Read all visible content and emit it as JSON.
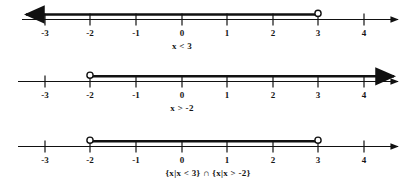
{
  "figure": {
    "title": "",
    "type": "number-line-inequality-diagram",
    "axis": {
      "tick_values": [
        -3,
        -2,
        -1,
        0,
        1,
        2,
        3,
        4
      ],
      "tick_labels": [
        "-3",
        "-2",
        "-1",
        "0",
        "1",
        "2",
        "3",
        "4"
      ],
      "x_min_visible": -3.6,
      "x_max_visible": 4.8
    },
    "lines": [
      {
        "id": "line-1",
        "caption": "x < 3",
        "caption_parts": {
          "variable": "x",
          "relation": "<",
          "value": "3"
        },
        "solution": {
          "kind": "ray-left",
          "endpoint": -3,
          "open_points": [
            3
          ],
          "arrow_left": true,
          "arrow_right": false
        },
        "baseline_arrow_left": true,
        "baseline_arrow_right": true
      },
      {
        "id": "line-2",
        "caption": "x > -2",
        "caption_parts": {
          "variable": "x",
          "relation": ">",
          "value": "-2"
        },
        "solution": {
          "kind": "ray-right",
          "endpoint": -2,
          "open_points": [
            -2
          ],
          "arrow_left": false,
          "arrow_right": true
        },
        "baseline_arrow_left": false,
        "baseline_arrow_right": true
      },
      {
        "id": "line-3",
        "caption": "{x|x < 3} ∩ {x|x > -2}",
        "caption_parts": {
          "set_a": "{x|x < 3}",
          "operator": "∩",
          "set_b": "{x|x > -2}"
        },
        "solution": {
          "kind": "segment",
          "open_points": [
            -2,
            3
          ],
          "arrow_left": false,
          "arrow_right": false
        },
        "baseline_arrow_left": false,
        "baseline_arrow_right": true
      }
    ],
    "colors": {
      "ink": "#111111",
      "background": "#ffffff"
    }
  }
}
